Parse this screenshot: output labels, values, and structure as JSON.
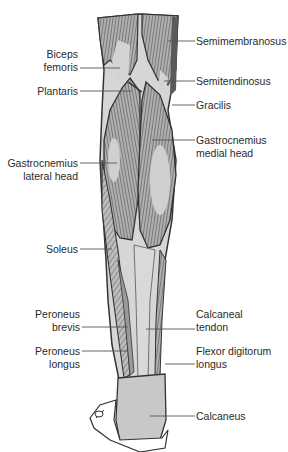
{
  "diagram": {
    "type": "anatomical-illustration",
    "colors": {
      "background": "#ffffff",
      "muscle_fill": "#a9a9a9",
      "muscle_light": "#d4d4d4",
      "tendon_fill": "#d9d9d9",
      "outline": "#3a3a3a",
      "leader_line": "#555555",
      "text": "#2a2a2a"
    },
    "labels_left": [
      {
        "id": "biceps-femoris",
        "line1": "Biceps",
        "line2": "femoris"
      },
      {
        "id": "plantaris",
        "line1": "Plantaris",
        "line2": ""
      },
      {
        "id": "gastrocnemius-lateral-head",
        "line1": "Gastrocnemius",
        "line2": "lateral head"
      },
      {
        "id": "soleus",
        "line1": "Soleus",
        "line2": ""
      },
      {
        "id": "peroneus-brevis",
        "line1": "Peroneus",
        "line2": "brevis"
      },
      {
        "id": "peroneus-longus",
        "line1": "Peroneus",
        "line2": "longus"
      }
    ],
    "labels_right": [
      {
        "id": "semimembranosus",
        "line1": "Semimembranosus",
        "line2": ""
      },
      {
        "id": "semitendinosus",
        "line1": "Semitendinosus",
        "line2": ""
      },
      {
        "id": "gracilis",
        "line1": "Gracilis",
        "line2": ""
      },
      {
        "id": "gastrocnemius-medial-head",
        "line1": "Gastrocnemius",
        "line2": "medial head"
      },
      {
        "id": "calcaneal-tendon",
        "line1": "Calcaneal",
        "line2": "tendon"
      },
      {
        "id": "flexor-digitorum-longus",
        "line1": "Flexor digitorum",
        "line2": "longus"
      },
      {
        "id": "calcaneus",
        "line1": "Calcaneus",
        "line2": ""
      }
    ]
  }
}
